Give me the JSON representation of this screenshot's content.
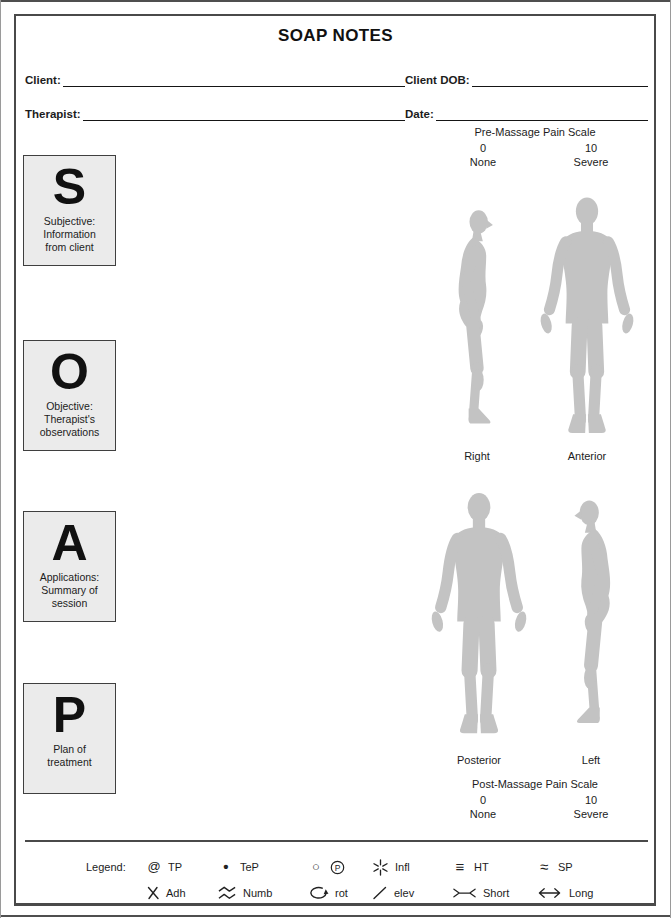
{
  "title": "SOAP NOTES",
  "fields": {
    "client_label": "Client:",
    "client_value": "",
    "client_dob_label": "Client DOB:",
    "client_dob_value": "",
    "therapist_label": "Therapist:",
    "therapist_value": "",
    "date_label": "Date:",
    "date_value": ""
  },
  "soap": [
    {
      "letter": "S",
      "description": "Subjective:\nInformation\nfrom client"
    },
    {
      "letter": "O",
      "description": "Objective:\nTherapist's\nobservations"
    },
    {
      "letter": "A",
      "description": "Applications:\nSummary of\nsession"
    },
    {
      "letter": "P",
      "description": "Plan of\ntreatment"
    }
  ],
  "pain_scales": {
    "pre": {
      "title": "Pre-Massage Pain Scale",
      "min_value": "0",
      "min_label": "None",
      "max_value": "10",
      "max_label": "Severe"
    },
    "post": {
      "title": "Post-Massage Pain Scale",
      "min_value": "0",
      "min_label": "None",
      "max_value": "10",
      "max_label": "Severe"
    }
  },
  "body_charts": {
    "top": [
      {
        "view": "Right"
      },
      {
        "view": "Anterior"
      }
    ],
    "bottom": [
      {
        "view": "Posterior"
      },
      {
        "view": "Left"
      }
    ]
  },
  "legend": {
    "heading": "Legend:",
    "items_row1": [
      {
        "icon": "at-icon",
        "symbol": "@",
        "label": "TP"
      },
      {
        "icon": "dot-icon",
        "symbol": "•",
        "label": "TeP"
      },
      {
        "icon": "circle-icon circled-p-icon",
        "symbol": "○",
        "symbol2": "P",
        "label": ""
      },
      {
        "icon": "inflammation-star-icon",
        "symbol": "",
        "label": "Infl"
      },
      {
        "icon": "triple-bar-icon",
        "symbol": "≡",
        "label": "HT"
      },
      {
        "icon": "approx-icon",
        "symbol": "≈",
        "label": "SP"
      }
    ],
    "items_row2": [
      {
        "icon": "x-mark-icon",
        "symbol": "",
        "label": "Adh"
      },
      {
        "icon": "zigzag-icon",
        "symbol": "",
        "label": "Numb"
      },
      {
        "icon": "rotation-arrow-icon",
        "symbol": "",
        "label": "rot"
      },
      {
        "icon": "slash-icon",
        "symbol": "",
        "label": "elev"
      },
      {
        "icon": "compress-arrows-icon",
        "symbol": "",
        "label": "Short"
      },
      {
        "icon": "long-arrow-icon",
        "symbol": "",
        "label": "Long"
      }
    ]
  },
  "colors": {
    "silhouette": "#c3c3c3",
    "box_background": "#ebebeb",
    "border": "#4a4a4a",
    "text": "#1c1c1c"
  }
}
